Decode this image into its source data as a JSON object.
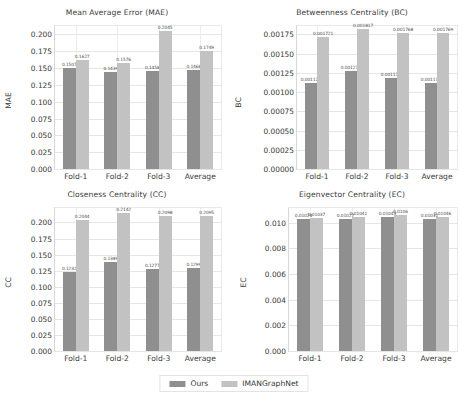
{
  "figure": {
    "background": "#ffffff",
    "colors": {
      "ours": "#8f8f8f",
      "imangraphnet": "#c2c2c2",
      "grid": "#e6e6e6",
      "text": "#3a3a3a"
    }
  },
  "legend": {
    "position": "bottom-center",
    "entries": [
      {
        "label": "Ours",
        "color": "#8f8f8f"
      },
      {
        "label": "IMANGraphNet",
        "color": "#c2c2c2"
      }
    ]
  },
  "chart_data": [
    {
      "type": "bar",
      "id": "mae",
      "title": "Mean Average Error (MAE)",
      "xlabel": "",
      "ylabel": "MAE",
      "categories": [
        "Fold-1",
        "Fold-2",
        "Fold-3",
        "Average"
      ],
      "ylim": [
        0.0,
        0.2125
      ],
      "yticks": [
        0.0,
        0.025,
        0.05,
        0.075,
        0.1,
        0.125,
        0.15,
        0.175,
        0.2
      ],
      "ytick_labels": [
        "0.000",
        "0.025",
        "0.050",
        "0.075",
        "0.100",
        "0.125",
        "0.150",
        "0.175",
        "0.200"
      ],
      "grid": true,
      "series": [
        {
          "name": "Ours",
          "color": "#8f8f8f",
          "values": [
            0.1507,
            0.1439,
            0.1458,
            0.1468
          ],
          "labels": [
            "0.1507",
            "0.1439",
            "0.1458",
            "0.1468"
          ]
        },
        {
          "name": "IMANGraphNet",
          "color": "#c2c2c2",
          "values": [
            0.1627,
            0.1576,
            0.2045,
            0.1749
          ],
          "labels": [
            "0.1627",
            "0.1576",
            "0.2045",
            "0.1749"
          ]
        }
      ]
    },
    {
      "type": "bar",
      "id": "bc",
      "title": "Betweenness Centrality (BC)",
      "xlabel": "",
      "ylabel": "BC",
      "categories": [
        "Fold-1",
        "Fold-2",
        "Fold-3",
        "Average"
      ],
      "ylim": [
        0.0,
        0.0018594
      ],
      "yticks": [
        0.0,
        0.00025,
        0.0005,
        0.00075,
        0.001,
        0.00125,
        0.0015,
        0.00175
      ],
      "ytick_labels": [
        "0.00000",
        "0.00025",
        "0.00050",
        "0.00075",
        "0.00100",
        "0.00125",
        "0.00150",
        "0.00175"
      ],
      "grid": true,
      "series": [
        {
          "name": "Ours",
          "color": "#8f8f8f",
          "values": [
            0.001121,
            0.001271,
            0.001179,
            0.001115
          ],
          "labels": [
            "0.001121",
            "0.001271",
            "0.001179",
            "0.001115"
          ]
        },
        {
          "name": "IMANGraphNet",
          "color": "#c2c2c2",
          "values": [
            0.001721,
            0.001817,
            0.001768,
            0.001769
          ],
          "labels": [
            "0.001721",
            "0.001817",
            "0.001768",
            "0.001769"
          ]
        }
      ]
    },
    {
      "type": "bar",
      "id": "cc",
      "title": "Closeness Centrality (CC)",
      "xlabel": "",
      "ylabel": "CC",
      "categories": [
        "Fold-1",
        "Fold-2",
        "Fold-3",
        "Average"
      ],
      "ylim": [
        0.0,
        0.2225
      ],
      "yticks": [
        0.0,
        0.025,
        0.05,
        0.075,
        0.1,
        0.125,
        0.15,
        0.175,
        0.2
      ],
      "ytick_labels": [
        "0.000",
        "0.025",
        "0.050",
        "0.075",
        "0.100",
        "0.125",
        "0.150",
        "0.175",
        "0.200"
      ],
      "grid": true,
      "series": [
        {
          "name": "Ours",
          "color": "#8f8f8f",
          "values": [
            0.1232,
            0.1389,
            0.1277,
            0.1299
          ],
          "labels": [
            "0.1232",
            "0.1389",
            "0.1277",
            "0.1299"
          ]
        },
        {
          "name": "IMANGraphNet",
          "color": "#c2c2c2",
          "values": [
            0.2044,
            0.2142,
            0.2098,
            0.2095
          ],
          "labels": [
            "0.2044",
            "0.2142",
            "0.2098",
            "0.2095"
          ]
        }
      ]
    },
    {
      "type": "bar",
      "id": "ec",
      "title": "Eigenvector Centrality (EC)",
      "xlabel": "",
      "ylabel": "EC",
      "categories": [
        "Fold-1",
        "Fold-2",
        "Fold-3",
        "Average"
      ],
      "ylim": [
        0.0,
        0.01113
      ],
      "yticks": [
        0.0,
        0.002,
        0.004,
        0.006,
        0.008,
        0.01
      ],
      "ytick_labels": [
        "0.000",
        "0.002",
        "0.004",
        "0.006",
        "0.008",
        "0.010"
      ],
      "grid": true,
      "series": [
        {
          "name": "Ours",
          "color": "#8f8f8f",
          "values": [
            0.01024,
            0.01027,
            0.01043,
            0.01031
          ],
          "labels": [
            "0.01024",
            "0.01027",
            "0.01043",
            "0.01031"
          ]
        },
        {
          "name": "IMANGraphNet",
          "color": "#c2c2c2",
          "values": [
            0.01037,
            0.01041,
            0.0106,
            0.01046
          ],
          "labels": [
            "0.01037",
            "0.01041",
            "0.0106",
            "0.01046"
          ]
        }
      ]
    }
  ]
}
